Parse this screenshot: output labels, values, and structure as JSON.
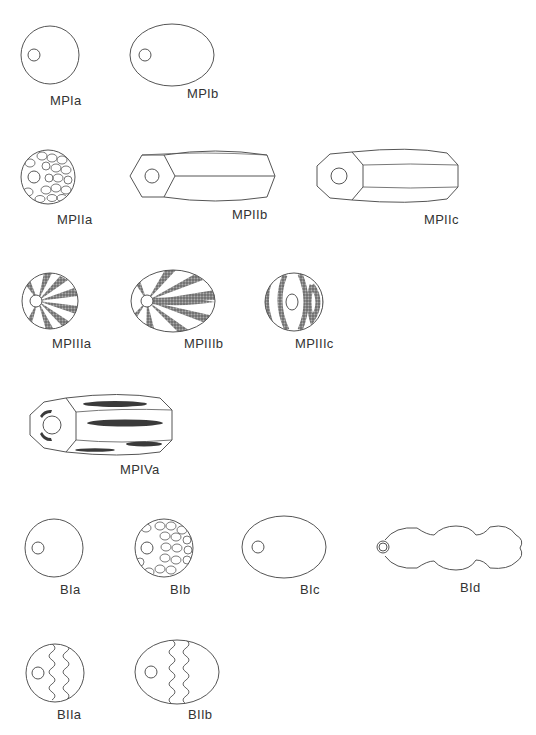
{
  "figure": {
    "groups": [
      {
        "group": "MPI",
        "items": [
          {
            "id": "MPIa",
            "label": "MPIa",
            "shape": "sphere",
            "decoration": "plain"
          },
          {
            "id": "MPIb",
            "label": "MPIb",
            "shape": "oval",
            "decoration": "plain"
          }
        ]
      },
      {
        "group": "MPII",
        "items": [
          {
            "id": "MPIIa",
            "label": "MPIIa",
            "shape": "sphere",
            "decoration": "faceted"
          },
          {
            "id": "MPIIb",
            "label": "MPIIb",
            "shape": "hexagonal-barrel",
            "decoration": "plain"
          },
          {
            "id": "MPIIc",
            "label": "MPIIc",
            "shape": "octagonal-barrel",
            "decoration": "plain"
          }
        ]
      },
      {
        "group": "MPIII",
        "items": [
          {
            "id": "MPIIIa",
            "label": "MPIIIa",
            "shape": "sphere",
            "decoration": "radial stripes"
          },
          {
            "id": "MPIIIb",
            "label": "MPIIIb",
            "shape": "oval",
            "decoration": "radial stripes"
          },
          {
            "id": "MPIIIc",
            "label": "MPIIIc",
            "shape": "sphere",
            "decoration": "concentric stripes"
          }
        ]
      },
      {
        "group": "MPIV",
        "items": [
          {
            "id": "MPIVa",
            "label": "MPIVa",
            "shape": "octagonal-barrel",
            "decoration": "dark streaks"
          }
        ]
      },
      {
        "group": "BI",
        "items": [
          {
            "id": "BIa",
            "label": "BIa",
            "shape": "sphere",
            "decoration": "plain"
          },
          {
            "id": "BIb",
            "label": "BIb",
            "shape": "sphere",
            "decoration": "faceted"
          },
          {
            "id": "BIc",
            "label": "BIc",
            "shape": "oval",
            "decoration": "plain"
          },
          {
            "id": "BId",
            "label": "BId",
            "shape": "segmented (4 lobes)",
            "decoration": "plain"
          }
        ]
      },
      {
        "group": "BII",
        "items": [
          {
            "id": "BIIa",
            "label": "BIIa",
            "shape": "sphere",
            "decoration": "wavy lines"
          },
          {
            "id": "BIIb",
            "label": "BIIb",
            "shape": "oval",
            "decoration": "wavy lines"
          }
        ]
      }
    ],
    "labels": {
      "MPIa": "MPIa",
      "MPIb": "MPIb",
      "MPIIa": "MPIIa",
      "MPIIb": "MPIIb",
      "MPIIc": "MPIIc",
      "MPIIIa": "MPIIIa",
      "MPIIIb": "MPIIIb",
      "MPIIIc": "MPIIIc",
      "MPIVa": "MPIVa",
      "BIa": "BIa",
      "BIb": "BIb",
      "BIc": "BIc",
      "BId": "BId",
      "BIIa": "BIIa",
      "BIIb": "BIIb"
    },
    "caption": "",
    "colors": {
      "line": "#555555",
      "stripe": "#6a6a6a",
      "background": "#ffffff"
    }
  }
}
